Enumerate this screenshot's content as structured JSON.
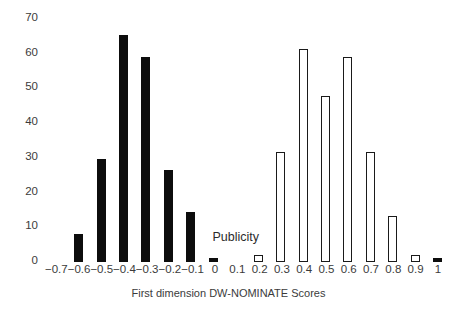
{
  "chart_data": {
    "type": "bar",
    "title": "",
    "xlabel": "First dimension DW-NOMINATE Scores",
    "ylabel": "",
    "ylim": [
      0,
      70
    ],
    "ytick_values": [
      70,
      60,
      50,
      40,
      30,
      20,
      10,
      0
    ],
    "ytick_labels": [
      "70",
      "60",
      "50",
      "40",
      "30",
      "20",
      "10",
      "0"
    ],
    "grid": false,
    "legend": false,
    "categories": [
      "−0.7",
      "−0.6",
      "−0.5",
      "−0.4",
      "−0.3",
      "−0.2",
      "−0.1",
      "0",
      "0.1",
      "0.2",
      "0.3",
      "0.4",
      "0.5",
      "0.6",
      "0.7",
      "0.8",
      "0.9",
      "1"
    ],
    "values": [
      0,
      8,
      29,
      64,
      58,
      26,
      14,
      1,
      0,
      2,
      31,
      60,
      47,
      58,
      31,
      13,
      2,
      1
    ],
    "bar_styles": [
      "empty",
      "filled",
      "filled",
      "filled",
      "filled",
      "filled",
      "filled",
      "filled",
      "empty",
      "hollow",
      "hollow",
      "hollow",
      "hollow",
      "hollow",
      "hollow",
      "hollow",
      "hollow",
      "filled"
    ],
    "annotations": [
      {
        "text": "Publicity",
        "x_category": "0.1",
        "y_value": 5
      }
    ],
    "colors": {
      "filled_bar": "#0d0d0d",
      "hollow_bar_fill": "#ffffff",
      "hollow_bar_stroke": "#1a1a1a",
      "text": "#3b3b3b",
      "background": "#ffffff"
    }
  }
}
